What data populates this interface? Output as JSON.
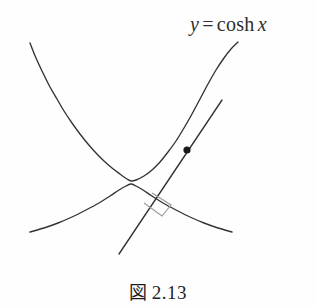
{
  "figure": {
    "caption_mark": "図",
    "caption_number": "2.13",
    "caption_full": "図 2.13",
    "background_color": "#fefefe",
    "stroke_color": "#333333",
    "accent_color": "#1a1a1a",
    "rightangle_color": "#9a9a9a"
  },
  "label": {
    "variable_y": "y",
    "equals": "=",
    "function_name": "cosh",
    "variable_x": "x",
    "full_text": "y = cosh x"
  },
  "chart_data": {
    "type": "line",
    "xlabel": "",
    "ylabel": "",
    "grid": false,
    "legend": "none",
    "annotations": [
      {
        "name": "curve-equation-label",
        "text": "y = cosh x",
        "x_px": 190,
        "y_px": 14
      },
      {
        "name": "tangency-point-dot",
        "text": "",
        "x_px": 187,
        "y_px": 150
      },
      {
        "name": "right-angle-marker",
        "text": "",
        "x_px": 162,
        "y_px": 204
      }
    ],
    "series": [
      {
        "name": "catenary",
        "label": "y = cosh x",
        "style": "solid",
        "color": "#333333",
        "points_px": [
          [
            30,
            43
          ],
          [
            36,
            58
          ],
          [
            43,
            73
          ],
          [
            50,
            87
          ],
          [
            57,
            99
          ],
          [
            64,
            111
          ],
          [
            72,
            123
          ],
          [
            80,
            134
          ],
          [
            88,
            144
          ],
          [
            96,
            153
          ],
          [
            104,
            161
          ],
          [
            112,
            168
          ],
          [
            120,
            174
          ],
          [
            127,
            179
          ],
          [
            131,
            181
          ],
          [
            136,
            180
          ],
          [
            144,
            176
          ],
          [
            152,
            170
          ],
          [
            160,
            162
          ],
          [
            168,
            152
          ],
          [
            176,
            141
          ],
          [
            184,
            128
          ],
          [
            192,
            114
          ],
          [
            200,
            99
          ],
          [
            208,
            84
          ],
          [
            216,
            70
          ],
          [
            224,
            58
          ],
          [
            231,
            49
          ],
          [
            238,
            42
          ]
        ]
      },
      {
        "name": "evolute",
        "label": "evolute of catenary",
        "style": "solid",
        "color": "#333333",
        "points_px": [
          [
            30,
            232
          ],
          [
            44,
            228
          ],
          [
            58,
            223
          ],
          [
            72,
            217
          ],
          [
            86,
            210
          ],
          [
            99,
            203
          ],
          [
            110,
            196
          ],
          [
            119,
            190
          ],
          [
            126,
            186
          ],
          [
            131,
            184
          ],
          [
            136,
            186
          ],
          [
            143,
            190
          ],
          [
            152,
            196
          ],
          [
            163,
            203
          ],
          [
            176,
            210
          ],
          [
            190,
            217
          ],
          [
            204,
            223
          ],
          [
            218,
            228
          ],
          [
            232,
            232
          ]
        ]
      },
      {
        "name": "tangent-line",
        "label": "tangent at point",
        "style": "solid",
        "color": "#333333",
        "points_px": [
          [
            119,
            254
          ],
          [
            222,
            100
          ]
        ]
      }
    ]
  }
}
